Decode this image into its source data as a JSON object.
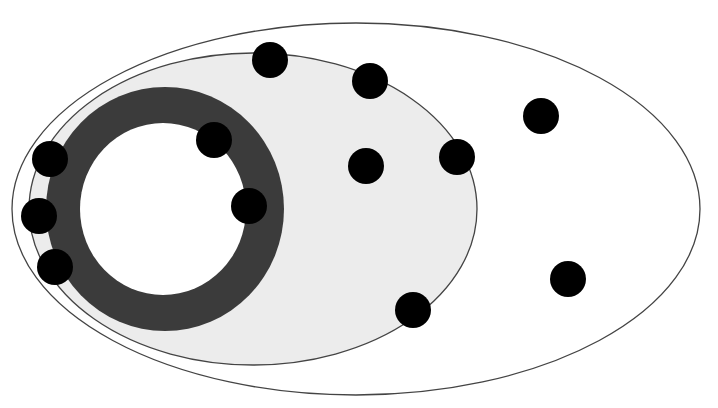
{
  "diagram": {
    "width": 718,
    "height": 408,
    "background": "#ffffff",
    "outer_ellipse": {
      "cx": 356,
      "cy": 209,
      "rx": 344,
      "ry": 186,
      "fill": "#ffffff",
      "stroke": "#444444",
      "stroke_width": 1.3
    },
    "inner_ellipse": {
      "cx": 253,
      "cy": 209,
      "rx": 224,
      "ry": 156,
      "fill": "#ececec",
      "stroke": "#444444",
      "stroke_width": 1.3
    },
    "ring": {
      "cx": 165,
      "cy": 209,
      "outer_rx": 119,
      "outer_ry": 122,
      "inner_rx": 83,
      "inner_ry": 86,
      "fill": "#3b3b3b",
      "hole_fill": "#ffffff"
    },
    "dot_color": "#000000",
    "dot_radius": 18,
    "dots": [
      {
        "cx": 270,
        "cy": 60
      },
      {
        "cx": 370,
        "cy": 81
      },
      {
        "cx": 214,
        "cy": 140
      },
      {
        "cx": 50,
        "cy": 159
      },
      {
        "cx": 366,
        "cy": 166
      },
      {
        "cx": 457,
        "cy": 157
      },
      {
        "cx": 541,
        "cy": 116
      },
      {
        "cx": 249,
        "cy": 206
      },
      {
        "cx": 39,
        "cy": 216
      },
      {
        "cx": 55,
        "cy": 267
      },
      {
        "cx": 568,
        "cy": 279
      },
      {
        "cx": 413,
        "cy": 310
      }
    ]
  }
}
